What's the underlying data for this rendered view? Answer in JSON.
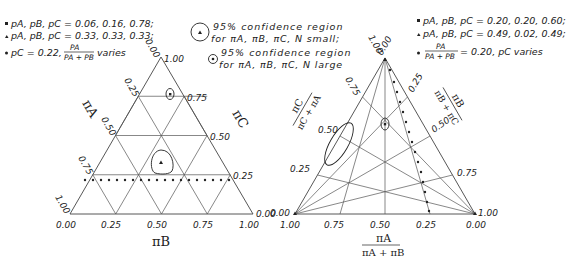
{
  "left_panel": {
    "legend": [
      {
        "marker": "square",
        "text": "pA, pB, pC = 0.06, 0.16, 0.78;"
      },
      {
        "marker": "triangle",
        "text": "pA, pB, pC = 0.33, 0.33, 0.33;"
      },
      {
        "marker": "dot",
        "text_prefix": "pC = 0.22,",
        "fraction_num": "PA",
        "fraction_den": "PA + PB",
        "text_suffix": "varies"
      }
    ],
    "axis_a_label": "πA",
    "axis_b_label": "πB",
    "axis_c_label": "πC",
    "a_ticks": [
      "0.00",
      "0.25",
      "0.50",
      "0.75",
      "1.00"
    ],
    "b_ticks": [
      "0.00",
      "0.25",
      "0.50",
      "0.75",
      "1.00"
    ],
    "c_ticks": [
      "0.00",
      "0.25",
      "0.50",
      "0.75",
      "1.00"
    ]
  },
  "center_legend": [
    {
      "marker": "circle-triangle",
      "line1": "95% confidence region",
      "line2": "for πA, πB, πC, N small;"
    },
    {
      "marker": "circle-dot",
      "line1": "95% confidence region",
      "line2": "for πA, πB, πC, N large"
    }
  ],
  "right_panel": {
    "legend": [
      {
        "marker": "square",
        "text": "pA, pB, pC = 0.20, 0.20, 0.60;"
      },
      {
        "marker": "triangle",
        "text": "pA, pB, pC = 0.49, 0.02, 0.49;"
      },
      {
        "marker": "dot",
        "fraction_num": "PA",
        "fraction_den": "PA + PB",
        "text_suffix": "= 0.20, pC varies"
      }
    ],
    "left_axis_label_num": "πC",
    "left_axis_label_den": "πC + πA",
    "right_axis_label_num": "πB",
    "right_axis_label_den": "πB + πC",
    "bottom_axis_label_num": "πA",
    "bottom_axis_label_den": "πA + πB",
    "left_ticks": [
      "0.25",
      "0.50",
      "0.75"
    ],
    "right_ticks": [
      "0.25",
      "0.50",
      "0.75"
    ],
    "bottom_ticks": [
      "1.00",
      "0.75",
      "0.50",
      "0.25",
      "0.00"
    ],
    "apex_labels": [
      "1.00",
      "0.00"
    ],
    "left_vertex_labels": [
      "0.00",
      "1.00"
    ],
    "right_vertex_labels": [
      "1.00",
      "0.00"
    ]
  }
}
